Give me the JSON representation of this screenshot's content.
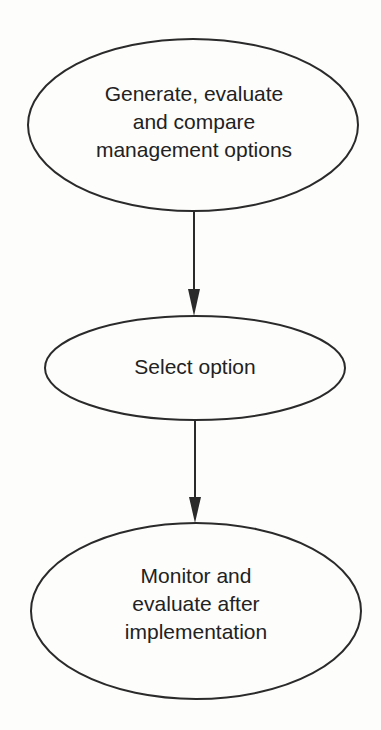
{
  "diagram": {
    "type": "flowchart",
    "direction": "top-to-bottom",
    "colors": {
      "background": "#fdfdfc",
      "stroke": "#2a2a2a",
      "text": "#222222"
    },
    "nodes": [
      {
        "id": "generate",
        "shape": "ellipse",
        "lines": [
          "Generate, evaluate",
          "and compare",
          "management options"
        ]
      },
      {
        "id": "select",
        "shape": "ellipse",
        "lines": [
          "Select option"
        ]
      },
      {
        "id": "monitor",
        "shape": "ellipse",
        "lines": [
          "Monitor and",
          "evaluate after",
          "implementation"
        ]
      }
    ],
    "edges": [
      {
        "from": "generate",
        "to": "select",
        "arrow": "end"
      },
      {
        "from": "select",
        "to": "monitor",
        "arrow": "end"
      }
    ]
  }
}
